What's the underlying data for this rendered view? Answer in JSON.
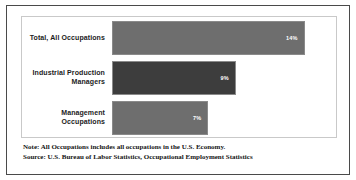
{
  "chart_data": {
    "type": "bar",
    "orientation": "horizontal",
    "title": "",
    "xlabel": "",
    "ylabel": "",
    "grid": false,
    "legend": "none",
    "xlim": [
      0,
      16
    ],
    "categories": [
      "Total, All Occupations",
      "Industrial Production Managers",
      "Management Occupations"
    ],
    "values": [
      14,
      9,
      7
    ],
    "data_labels": [
      "14%",
      "9%",
      "7%"
    ],
    "bar_colors": [
      "#6e6e6e",
      "#3d3d3d",
      "#6e6e6e"
    ],
    "annotations": [
      "Note: All Occupations includes all occupations in the U.S. Economy.",
      "Source: U.S. Bureau of Labor Statistics, Occupational Employment Statistics"
    ]
  },
  "footnotes": {
    "note": "Note: All Occupations includes all occupations in the U.S. Economy.",
    "source": "Source: U.S. Bureau of Labor Statistics, Occupational Employment Statistics"
  },
  "colors": {
    "bar_light": "#6e6e6e",
    "bar_dark": "#3d3d3d",
    "frame": "#4a4a4a",
    "plot_border": "#c9c9c9",
    "label_text": "#1c1c1c",
    "value_text": "#ffffff"
  }
}
